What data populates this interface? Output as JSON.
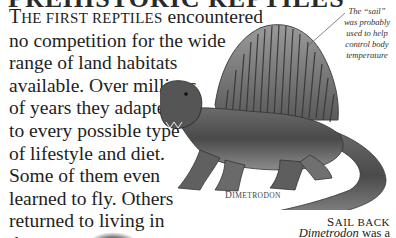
{
  "page": {
    "heading_cropped": "PREHISTORIC REPTILES",
    "intro": {
      "lead_small_caps_first": "T",
      "lead_small_caps_rest": "HE FIRST REPTILES",
      "lines": [
        " encountered",
        "no competition for the wide",
        "range of land habitats",
        "available. Over millions",
        "of years they adapted",
        "to every possible type",
        "of lifestyle and diet.",
        "Some of them even",
        "learned to fly. Others",
        "returned to living in",
        "the sea."
      ]
    },
    "annotation": {
      "lines": [
        "The “sail”",
        "was probably",
        "used to help",
        "control body",
        "temperature"
      ]
    },
    "illustration": {
      "subject": "dimetrodon-illustration",
      "caption_first": "D",
      "caption_rest": "IMETRODON"
    },
    "sidebar": {
      "title_first": "S",
      "title_rest": "AIL BACK",
      "text_italic": "Dimetrodon",
      "text_rest": " was a"
    },
    "colors": {
      "text": "#1e1e1e",
      "background": "#ffffff",
      "illustration_dark": "#3a3a3a",
      "illustration_mid": "#8a8a8a"
    }
  }
}
